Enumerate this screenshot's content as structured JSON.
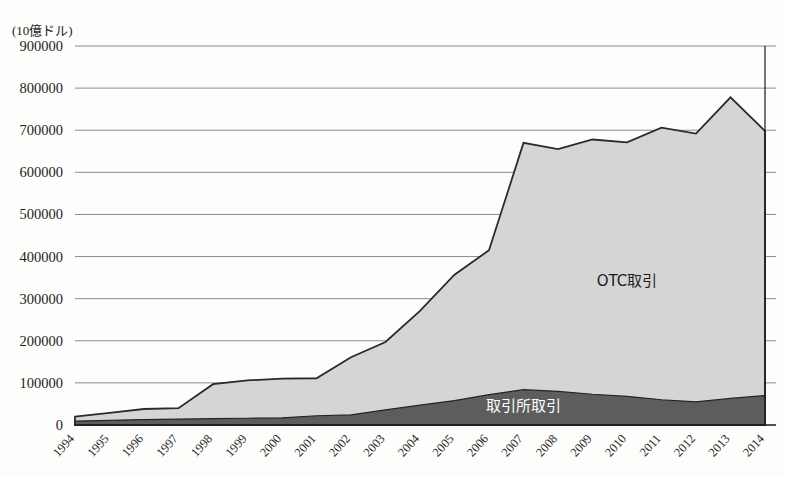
{
  "chart_data": {
    "type": "area",
    "title": "",
    "subtitle": "",
    "unit_label": "(10億ドル)",
    "xlabel": "",
    "ylabel": "",
    "stacked": true,
    "grid": true,
    "legend_position": "inline-annotation",
    "ylim": [
      0,
      900000
    ],
    "ytick_step": 100000,
    "ytick_labels": [
      "900000",
      "800000",
      "700000",
      "600000",
      "500000",
      "400000",
      "300000",
      "200000",
      "100000",
      "0"
    ],
    "ytick_values": [
      900000,
      800000,
      700000,
      600000,
      500000,
      400000,
      300000,
      200000,
      100000,
      0
    ],
    "categories": [
      "1994",
      "1995",
      "1996",
      "1997",
      "1998",
      "1999",
      "2000",
      "2001",
      "2002",
      "2003",
      "2004",
      "2005",
      "2006",
      "2007",
      "2008",
      "2009",
      "2010",
      "2011",
      "2012",
      "2013",
      "2014"
    ],
    "x": [
      1994,
      1995,
      1996,
      1997,
      1998,
      1999,
      2000,
      2001,
      2002,
      2003,
      2004,
      2005,
      2006,
      2007,
      2008,
      2009,
      2010,
      2011,
      2012,
      2013,
      2014
    ],
    "series": [
      {
        "name": "取引所取引",
        "label": "取引所取引",
        "color": "#5d5d5d",
        "stack_order": 1,
        "values": [
          9000,
          11000,
          13000,
          14000,
          15000,
          16000,
          17000,
          22000,
          24000,
          36000,
          47000,
          58000,
          72000,
          84000,
          80000,
          73000,
          68000,
          60000,
          55000,
          63000,
          70000
        ]
      },
      {
        "name": "OTC取引",
        "label": "OTC取引",
        "color": "#d5d5d5",
        "stack_order": 2,
        "values": [
          11000,
          18000,
          25000,
          26000,
          82000,
          90000,
          93000,
          89000,
          137000,
          161000,
          224000,
          299000,
          343000,
          586000,
          575000,
          605000,
          603000,
          646000,
          637000,
          715000,
          628000
        ]
      }
    ],
    "stacked_totals": [
      20000,
      29000,
      38000,
      40000,
      97000,
      106000,
      110000,
      111000,
      161000,
      197000,
      271000,
      357000,
      415000,
      670000,
      655000,
      678000,
      671000,
      706000,
      692000,
      778000,
      698000
    ],
    "annotations": [
      {
        "name": "otc-series-label",
        "text": "OTC取引",
        "x_year": 2010,
        "y_value": 330000
      },
      {
        "name": "exchange-series-label",
        "text": "取引所取引",
        "x_year": 2007,
        "y_value": 34000
      }
    ],
    "colors": {
      "otc_fill": "#d5d5d5",
      "exchange_fill": "#5d5d5d",
      "gridline": "#8b8b8b",
      "axis": "#1a1a1a",
      "background": "#fdfdfc"
    }
  }
}
